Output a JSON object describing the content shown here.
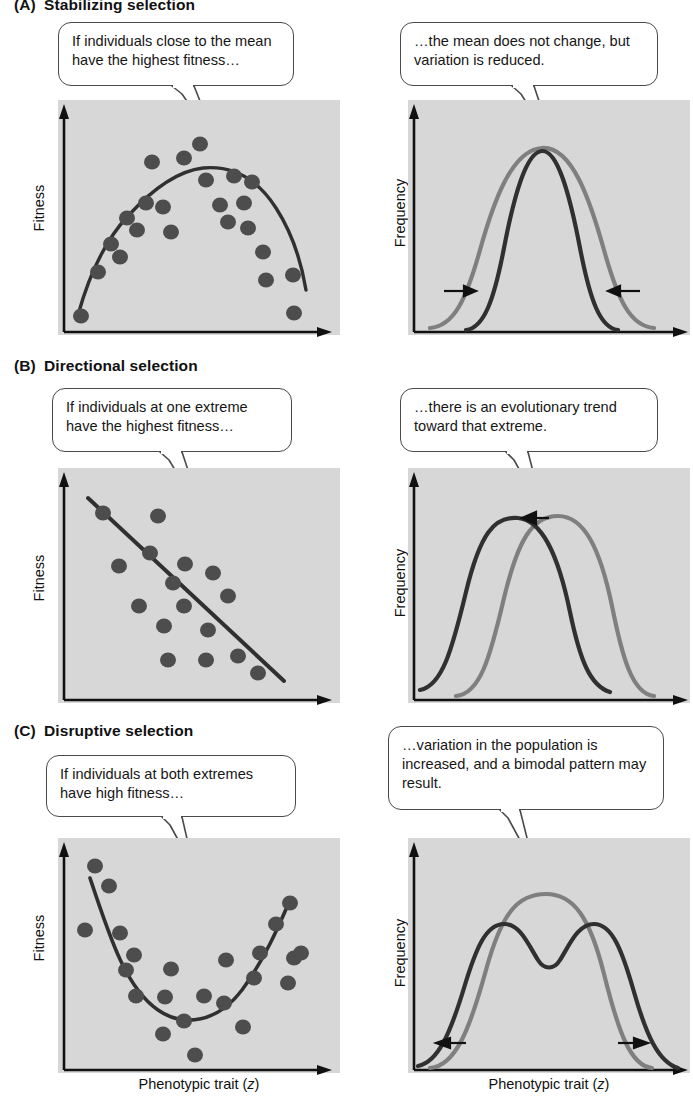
{
  "figure": {
    "axis_y_fitness": "Fitness",
    "axis_y_frequency": "Frequency",
    "axis_x_left": "Phenotypic trait (z)",
    "axis_x_right": "Phenotypic trait (z)"
  },
  "sections": [
    {
      "letter": "(A)",
      "title": "Stabilizing selection",
      "left_callout": "If individuals close to the mean have the highest fitness…",
      "right_callout": "…the mean does not change, but variation is reduced."
    },
    {
      "letter": "(B)",
      "title": "Directional selection",
      "left_callout": "If individuals at one extreme have the highest fitness…",
      "right_callout": "…there is an evolutionary trend toward that extreme."
    },
    {
      "letter": "(C)",
      "title": "Disruptive selection",
      "left_callout": "If individuals at both extremes have high fitness…",
      "right_callout": "…variation in the population is increased, and a bimodal pattern may result."
    }
  ],
  "colors": {
    "panel_background": "#d7d7d7",
    "dark_curve": "#303030",
    "gray_curve": "#7f7f7f",
    "point_fill": "#4d4d4d",
    "axis": "#111111",
    "bubble_border": "#4a4a4a",
    "bubble_fill": "#ffffff"
  },
  "chart_data": [
    {
      "id": "A-left",
      "type": "scatter",
      "title": "Stabilizing selection — fitness vs phenotypic trait",
      "xlabel": "Phenotypic trait (z)",
      "ylabel": "Fitness",
      "xlim": [
        0,
        100
      ],
      "ylim": [
        0,
        100
      ],
      "grid": false,
      "legend": "none",
      "curve_shape": "concave-down parabola (peak at mid trait value)",
      "curve": [
        {
          "x": 8,
          "y": 8
        },
        {
          "x": 16,
          "y": 27
        },
        {
          "x": 24,
          "y": 43
        },
        {
          "x": 34,
          "y": 57
        },
        {
          "x": 44,
          "y": 66
        },
        {
          "x": 52,
          "y": 70
        },
        {
          "x": 60,
          "y": 69
        },
        {
          "x": 70,
          "y": 62
        },
        {
          "x": 80,
          "y": 49
        },
        {
          "x": 88,
          "y": 33
        },
        {
          "x": 95,
          "y": 16
        }
      ],
      "points": [
        {
          "x": 8,
          "y": 5
        },
        {
          "x": 13,
          "y": 24
        },
        {
          "x": 18,
          "y": 39
        },
        {
          "x": 22,
          "y": 33
        },
        {
          "x": 24,
          "y": 52
        },
        {
          "x": 28,
          "y": 47
        },
        {
          "x": 31,
          "y": 60
        },
        {
          "x": 33,
          "y": 80
        },
        {
          "x": 38,
          "y": 57
        },
        {
          "x": 41,
          "y": 43
        },
        {
          "x": 45,
          "y": 82
        },
        {
          "x": 50,
          "y": 91
        },
        {
          "x": 53,
          "y": 70
        },
        {
          "x": 58,
          "y": 54
        },
        {
          "x": 61,
          "y": 46
        },
        {
          "x": 64,
          "y": 73
        },
        {
          "x": 68,
          "y": 60
        },
        {
          "x": 72,
          "y": 71
        },
        {
          "x": 74,
          "y": 45
        },
        {
          "x": 79,
          "y": 34
        },
        {
          "x": 82,
          "y": 24
        },
        {
          "x": 92,
          "y": 25
        },
        {
          "x": 93,
          "y": 8
        }
      ]
    },
    {
      "id": "A-right",
      "type": "line",
      "title": "Stabilizing selection — frequency distributions",
      "xlabel": "Phenotypic trait (z)",
      "ylabel": "Frequency",
      "xlim": [
        0,
        100
      ],
      "ylim": [
        0,
        100
      ],
      "grid": false,
      "legend": "none",
      "annotations": [
        "inward arrow left",
        "inward arrow right"
      ],
      "series": [
        {
          "name": "before selection (broad)",
          "color": "#7f7f7f",
          "mean": 50,
          "sd": 16,
          "peak": 95
        },
        {
          "name": "after selection (narrow)",
          "color": "#303030",
          "mean": 50,
          "sd": 9,
          "peak": 94
        }
      ]
    },
    {
      "id": "B-left",
      "type": "scatter",
      "title": "Directional selection — fitness vs phenotypic trait",
      "xlabel": "Phenotypic trait (z)",
      "ylabel": "Fitness",
      "xlim": [
        0,
        100
      ],
      "ylim": [
        0,
        100
      ],
      "grid": false,
      "legend": "none",
      "curve_shape": "negative straight line",
      "curve": [
        {
          "x": 10,
          "y": 88
        },
        {
          "x": 95,
          "y": 6
        }
      ],
      "points": [
        {
          "x": 16,
          "y": 82
        },
        {
          "x": 22,
          "y": 59
        },
        {
          "x": 33,
          "y": 81
        },
        {
          "x": 30,
          "y": 68
        },
        {
          "x": 26,
          "y": 45
        },
        {
          "x": 37,
          "y": 62
        },
        {
          "x": 41,
          "y": 40
        },
        {
          "x": 45,
          "y": 30
        },
        {
          "x": 44,
          "y": 66
        },
        {
          "x": 50,
          "y": 56
        },
        {
          "x": 56,
          "y": 63
        },
        {
          "x": 60,
          "y": 52
        },
        {
          "x": 55,
          "y": 34
        },
        {
          "x": 59,
          "y": 18
        },
        {
          "x": 66,
          "y": 19
        },
        {
          "x": 72,
          "y": 20
        },
        {
          "x": 78,
          "y": 11
        },
        {
          "x": 35,
          "y": 17
        }
      ]
    },
    {
      "id": "B-right",
      "type": "line",
      "title": "Directional selection — frequency distributions",
      "xlabel": "Phenotypic trait (z)",
      "ylabel": "Frequency",
      "xlim": [
        0,
        100
      ],
      "ylim": [
        0,
        100
      ],
      "grid": false,
      "legend": "none",
      "annotations": [
        "leftward arrow at peak"
      ],
      "series": [
        {
          "name": "before selection",
          "color": "#7f7f7f",
          "mean": 57,
          "sd": 15,
          "peak": 88
        },
        {
          "name": "after selection (shifted left)",
          "color": "#303030",
          "mean": 40,
          "sd": 15,
          "peak": 90
        }
      ]
    },
    {
      "id": "C-left",
      "type": "scatter",
      "title": "Disruptive selection — fitness vs phenotypic trait",
      "xlabel": "Phenotypic trait (z)",
      "ylabel": "Fitness",
      "xlim": [
        0,
        100
      ],
      "ylim": [
        0,
        100
      ],
      "grid": false,
      "legend": "none",
      "curve_shape": "concave-up parabola (minimum at mid trait value)",
      "curve": [
        {
          "x": 8,
          "y": 82
        },
        {
          "x": 16,
          "y": 63
        },
        {
          "x": 24,
          "y": 46
        },
        {
          "x": 33,
          "y": 33
        },
        {
          "x": 42,
          "y": 23
        },
        {
          "x": 50,
          "y": 19
        },
        {
          "x": 58,
          "y": 22
        },
        {
          "x": 68,
          "y": 33
        },
        {
          "x": 78,
          "y": 50
        },
        {
          "x": 87,
          "y": 68
        },
        {
          "x": 92,
          "y": 79
        }
      ],
      "points": [
        {
          "x": 9,
          "y": 88
        },
        {
          "x": 15,
          "y": 79
        },
        {
          "x": 6,
          "y": 59
        },
        {
          "x": 19,
          "y": 57
        },
        {
          "x": 24,
          "y": 48
        },
        {
          "x": 21,
          "y": 41
        },
        {
          "x": 25,
          "y": 32
        },
        {
          "x": 33,
          "y": 31
        },
        {
          "x": 35,
          "y": 43
        },
        {
          "x": 37,
          "y": 18
        },
        {
          "x": 44,
          "y": 22
        },
        {
          "x": 48,
          "y": 32
        },
        {
          "x": 50,
          "y": 12
        },
        {
          "x": 51,
          "y": 5
        },
        {
          "x": 57,
          "y": 48
        },
        {
          "x": 58,
          "y": 28
        },
        {
          "x": 67,
          "y": 38
        },
        {
          "x": 67,
          "y": 19
        },
        {
          "x": 70,
          "y": 50
        },
        {
          "x": 77,
          "y": 66
        },
        {
          "x": 79,
          "y": 35
        },
        {
          "x": 85,
          "y": 82
        },
        {
          "x": 90,
          "y": 50
        },
        {
          "x": 91,
          "y": 36
        }
      ]
    },
    {
      "id": "C-right",
      "type": "line",
      "title": "Disruptive selection — frequency distributions",
      "xlabel": "Phenotypic trait (z)",
      "ylabel": "Frequency",
      "xlim": [
        0,
        100
      ],
      "ylim": [
        0,
        100
      ],
      "grid": false,
      "legend": "none",
      "annotations": [
        "outward arrow left",
        "outward arrow right"
      ],
      "series": [
        {
          "name": "before selection (unimodal)",
          "color": "#7f7f7f",
          "mean": 50,
          "sd": 15,
          "peak": 92
        },
        {
          "name": "after selection (bimodal)",
          "color": "#303030",
          "modes": [
            36,
            64
          ],
          "valley_depth": 52,
          "peak": 78
        }
      ]
    }
  ]
}
